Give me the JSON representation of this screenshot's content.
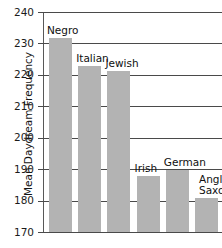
{
  "header": {
    "cropped_text": "· ·  ·   ·"
  },
  "chart_data": {
    "type": "bar",
    "title": "",
    "xlabel": "",
    "ylabel": "Mean Daydream Frequency",
    "ylim": [
      170,
      240
    ],
    "yticks": [
      170,
      180,
      190,
      200,
      210,
      220,
      230,
      240
    ],
    "ytick_labels": [
      "170",
      "180",
      "190",
      "200",
      "210",
      "220",
      "230",
      "240"
    ],
    "grid": true,
    "legend": "none",
    "bar_color": "#b3b3b3",
    "categories": [
      "Negro",
      "Italian",
      "Jewish",
      "Irish",
      "German",
      "Anglo-Saxon"
    ],
    "values": [
      232,
      223,
      221.5,
      188,
      190,
      181
    ],
    "bars": [
      {
        "label": "Negro",
        "value": 232,
        "label_lines": [
          "Negro"
        ]
      },
      {
        "label": "Italian",
        "value": 223,
        "label_lines": [
          "Italian"
        ]
      },
      {
        "label": "Jewish",
        "value": 221.5,
        "label_lines": [
          "Jewish"
        ]
      },
      {
        "label": "Irish",
        "value": 188,
        "label_lines": [
          "Irish"
        ]
      },
      {
        "label": "German",
        "value": 190,
        "label_lines": [
          "German"
        ]
      },
      {
        "label": "Anglo-Saxon",
        "value": 181,
        "label_lines": [
          "Anglo-",
          "Saxon"
        ]
      }
    ]
  }
}
